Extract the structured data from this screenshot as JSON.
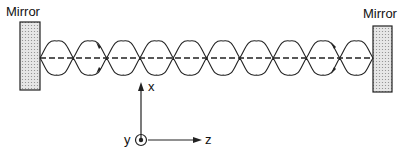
{
  "labels": {
    "mirror_left": "Mirror",
    "mirror_right": "Mirror",
    "axis_x": "x",
    "axis_y": "y",
    "axis_z": "z"
  },
  "diagram": {
    "lobes": 10,
    "optical_axis": "dashed",
    "colors": {
      "line": "#222222",
      "mirror_fill": "#d9d9d9"
    }
  }
}
